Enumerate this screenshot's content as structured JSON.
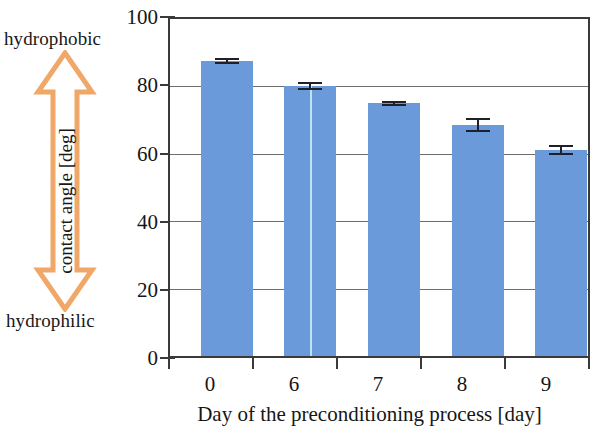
{
  "chart_data": {
    "type": "bar",
    "title": "",
    "xlabel": "Day of the preconditioning process [day]",
    "ylabel": "contact angle [deg]",
    "categories": [
      "0",
      "6",
      "7",
      "8",
      "9"
    ],
    "values": [
      87.5,
      80.0,
      75.0,
      68.5,
      61.0
    ],
    "errors": [
      0.8,
      1.2,
      0.8,
      2.0,
      1.5
    ],
    "ylim": [
      0,
      100
    ],
    "yticks": [
      0,
      20,
      40,
      60,
      80,
      100
    ],
    "ytick_labels": [
      "0",
      "20",
      "40",
      "60",
      "80",
      "100"
    ],
    "grid": "horizontal",
    "legend": "none",
    "bar_color": "#6a9ad9",
    "error_bar_color": "#20202a",
    "axis_color": "#3a3a3a",
    "gridline_color": "#6e6e6e",
    "annotations": {
      "arrow_color": "#f0a868",
      "arrow_top_label": "hydrophobic",
      "arrow_bottom_label": "hydrophilic",
      "arrow_type": "double-headed-vertical"
    }
  },
  "axis": {
    "y_title": "contact angle [deg]",
    "x_title": "Day of the preconditioning process [day]"
  },
  "annotation": {
    "top_label": "hydrophobic",
    "bottom_label": "hydrophilic"
  }
}
